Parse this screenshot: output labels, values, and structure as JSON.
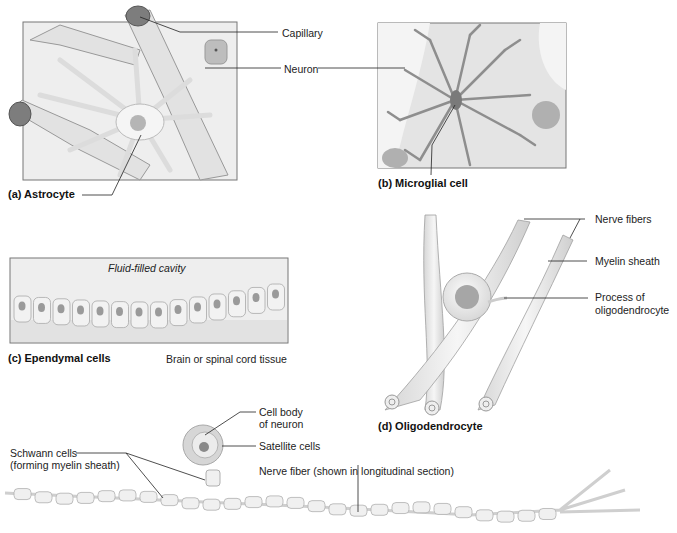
{
  "figure": {
    "panels": [
      {
        "id": "a",
        "caption": "(a) Astrocyte"
      },
      {
        "id": "b",
        "caption": "(b) Microglial cell"
      },
      {
        "id": "c",
        "caption": "(c) Ependymal cells"
      },
      {
        "id": "d",
        "caption": "(d) Oligodendrocyte"
      }
    ],
    "labels": {
      "capillary": "Capillary",
      "neuron": "Neuron",
      "fluid_cavity": "Fluid-filled cavity",
      "brain_tissue": "Brain or spinal cord tissue",
      "nerve_fibers": "Nerve fibers",
      "myelin_sheath": "Myelin sheath",
      "process_1": "Process of",
      "process_2": "oligodendrocyte",
      "cell_body_1": "Cell body",
      "cell_body_2": "of neuron",
      "satellite": "Satellite cells",
      "schwann_1": "Schwann cells",
      "schwann_2": "(forming myelin sheath)",
      "nerve_fiber_long": "Nerve fiber (shown in longitudinal section)"
    },
    "colors": {
      "tissue": "#e6e6e6",
      "cell": "#f3f3f3",
      "outline": "#9a9a9a",
      "nucleus": "#8c8c8c",
      "microglia": "#8e8e8e",
      "leader": "#222222"
    }
  }
}
